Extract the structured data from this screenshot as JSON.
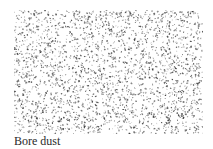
{
  "figure": {
    "dot_color": "#3a3a3a",
    "background": "#ffffff"
  },
  "caption": "Bore dust"
}
